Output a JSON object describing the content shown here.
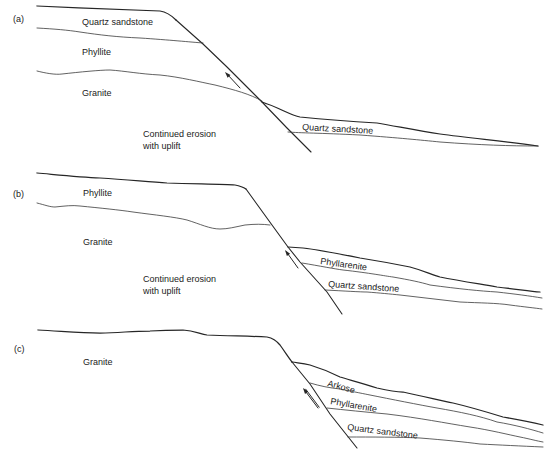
{
  "figure": {
    "type": "geologic cross-section sequence",
    "colors": {
      "line": "#262626",
      "text": "#222222",
      "background": "#ffffff"
    },
    "panels": [
      {
        "tag": "(a)",
        "upthrown_block": {
          "layers_top_to_bottom": [
            "Quartz sandstone",
            "Phyllite",
            "Granite"
          ]
        },
        "annotation": {
          "line1": "Continued erosion",
          "line2": "with uplift"
        },
        "basin_fill": {
          "layers_top_to_bottom": [
            "Quartz sandstone"
          ]
        },
        "fault_arrow": "up"
      },
      {
        "tag": "(b)",
        "upthrown_block": {
          "layers_top_to_bottom": [
            "Phyllite",
            "Granite"
          ]
        },
        "annotation": {
          "line1": "Continued erosion",
          "line2": "with uplift"
        },
        "basin_fill": {
          "layers_top_to_bottom": [
            "Phyllarenite",
            "Quartz sandstone"
          ]
        },
        "fault_arrow": "up"
      },
      {
        "tag": "(c)",
        "upthrown_block": {
          "layers_top_to_bottom": [
            "Granite"
          ]
        },
        "basin_fill": {
          "layers_top_to_bottom": [
            "Arkose",
            "Phyllarenite",
            "Quartz sandstone"
          ]
        },
        "fault_arrow": "up"
      }
    ]
  }
}
